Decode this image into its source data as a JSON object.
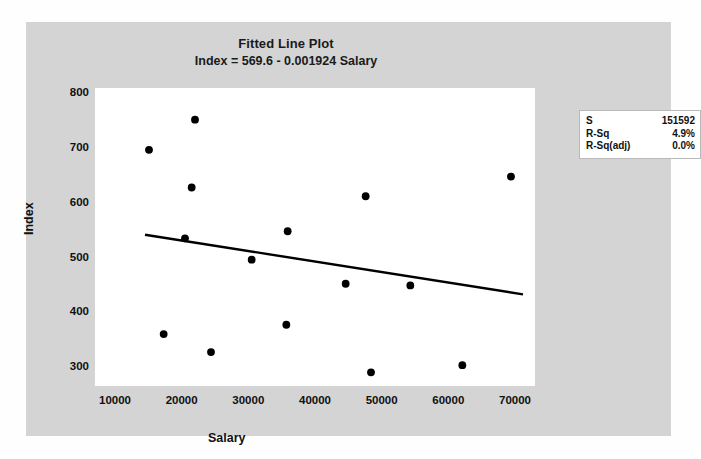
{
  "chart_data": {
    "type": "scatter",
    "title": "Fitted Line Plot",
    "subtitle": "Index = 569.6 - 0.001924 Salary",
    "xlabel": "Salary",
    "ylabel": "Index",
    "xlim": [
      7000,
      73000
    ],
    "ylim": [
      265,
      810
    ],
    "xticks": [
      "10000",
      "20000",
      "30000",
      "40000",
      "50000",
      "60000",
      "70000"
    ],
    "xtick_values": [
      10000,
      20000,
      30000,
      40000,
      50000,
      60000,
      70000
    ],
    "yticks": [
      "300",
      "400",
      "500",
      "600",
      "700",
      "800"
    ],
    "ytick_values": [
      300,
      400,
      500,
      600,
      700,
      800
    ],
    "grid": false,
    "legend": "none",
    "marker_color": "#000000",
    "line_color": "#000000",
    "points": [
      {
        "x": 15100,
        "y": 697
      },
      {
        "x": 22000,
        "y": 752
      },
      {
        "x": 21500,
        "y": 628
      },
      {
        "x": 20500,
        "y": 535
      },
      {
        "x": 30500,
        "y": 496
      },
      {
        "x": 17300,
        "y": 360
      },
      {
        "x": 24400,
        "y": 327
      },
      {
        "x": 35700,
        "y": 377
      },
      {
        "x": 35900,
        "y": 548
      },
      {
        "x": 44600,
        "y": 452
      },
      {
        "x": 47600,
        "y": 612
      },
      {
        "x": 48400,
        "y": 290
      },
      {
        "x": 54300,
        "y": 449
      },
      {
        "x": 62100,
        "y": 303
      },
      {
        "x": 69400,
        "y": 648
      }
    ],
    "fit_line": {
      "equation": "Index = 569.6 - 0.001924 Salary",
      "intercept": 569.6,
      "slope": -0.001924,
      "x_start": 14500,
      "x_end": 71200
    },
    "stats": [
      {
        "key": "S",
        "value": "151592"
      },
      {
        "key": "R-Sq",
        "value": "4.9%"
      },
      {
        "key": "R-Sq(adj)",
        "value": "0.0%"
      }
    ]
  },
  "colors": {
    "chart_background": "#d4d4d4",
    "panel_background": "#ffffff",
    "ink": "#111111"
  }
}
